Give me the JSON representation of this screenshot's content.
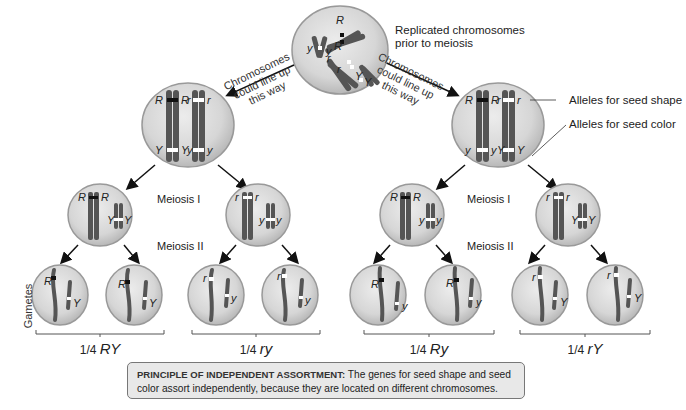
{
  "top": {
    "caption_line1": "Replicated chromosomes",
    "caption_line2": "prior to meiosis",
    "alleles": [
      "R",
      "R",
      "r",
      "r",
      "y",
      "y",
      "Y",
      "Y"
    ]
  },
  "left_branch": {
    "arrow_label": [
      "Chromosomes",
      "could line up",
      "this way"
    ],
    "metaphase_alleles": {
      "top": [
        "R",
        "R",
        "r",
        "r"
      ],
      "bottom": [
        "Y",
        "Y",
        "y",
        "y"
      ]
    },
    "meiosis1_label": "Meiosis I",
    "meiosis2_label": "Meiosis II",
    "cell_a": {
      "alleles": [
        "R",
        "R",
        "Y",
        "Y"
      ]
    },
    "cell_b": {
      "alleles": [
        "r",
        "r",
        "y",
        "y"
      ]
    },
    "gametes": [
      {
        "big": "R",
        "small": "Y"
      },
      {
        "big": "R",
        "small": "Y"
      },
      {
        "big": "r",
        "small": "y"
      },
      {
        "big": "r",
        "small": "y"
      }
    ],
    "fractions": [
      {
        "prefix": "1/4 ",
        "genotype": "RY"
      },
      {
        "prefix": "1/4 ",
        "genotype": "ry"
      }
    ]
  },
  "right_branch": {
    "arrow_label": [
      "Chromosomes",
      "could line up",
      "this way"
    ],
    "metaphase_alleles": {
      "top": [
        "R",
        "R",
        "r",
        "r"
      ],
      "bottom": [
        "y",
        "y",
        "Y",
        "Y"
      ]
    },
    "callouts": {
      "seed_shape": "Alleles for seed shape",
      "seed_color": "Alleles for seed color"
    },
    "meiosis1_label": "Meiosis I",
    "meiosis2_label": "Meiosis II",
    "cell_a": {
      "alleles": [
        "R",
        "R",
        "y",
        "y"
      ]
    },
    "cell_b": {
      "alleles": [
        "r",
        "r",
        "Y",
        "Y"
      ]
    },
    "gametes": [
      {
        "big": "R",
        "small": "y"
      },
      {
        "big": "R",
        "small": "y"
      },
      {
        "big": "r",
        "small": "Y"
      },
      {
        "big": "r",
        "small": "Y"
      }
    ],
    "fractions": [
      {
        "prefix": "1/4 ",
        "genotype": "Ry"
      },
      {
        "prefix": "1/4 ",
        "genotype": "rY"
      }
    ]
  },
  "side_label": "Gametes",
  "principle": {
    "title": "PRINCIPLE OF INDEPENDENT ASSORTMENT:",
    "text": " The genes for seed shape and seed color assort independently, because they are located on different chromosomes."
  },
  "colors": {
    "cell_fill": "#d9d9d9",
    "cell_edge": "#9a9a9a",
    "chromosome": "#5a5a5a",
    "dominant_marker": "#111111",
    "recessive_marker": "#ffffff",
    "box_fill": "#e8e8e8"
  }
}
